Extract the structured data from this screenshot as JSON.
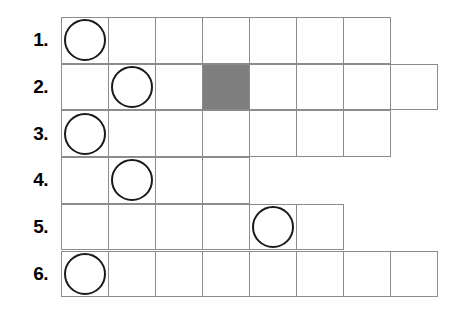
{
  "worksheet": {
    "title": "Counting grid worksheet",
    "grid": {
      "cell_width": 48,
      "cell_height": 46.7,
      "origin_x": 61,
      "origin_y": 17,
      "line_color": "#8c8c8c",
      "shaded_color": "#7f7f7f",
      "token_border_color": "#1a1a1a",
      "token_fill_color": "#ffffff"
    },
    "rows": [
      {
        "label": "1.",
        "cell_count": 7,
        "cells": [
          {
            "index": 1,
            "token": "circle",
            "shaded": false
          },
          {
            "index": 2,
            "token": null,
            "shaded": false
          },
          {
            "index": 3,
            "token": null,
            "shaded": false
          },
          {
            "index": 4,
            "token": null,
            "shaded": false
          },
          {
            "index": 5,
            "token": null,
            "shaded": false
          },
          {
            "index": 6,
            "token": null,
            "shaded": false
          },
          {
            "index": 7,
            "token": null,
            "shaded": false
          }
        ]
      },
      {
        "label": "2.",
        "cell_count": 8,
        "cells": [
          {
            "index": 1,
            "token": null,
            "shaded": false
          },
          {
            "index": 2,
            "token": "circle",
            "shaded": false
          },
          {
            "index": 3,
            "token": null,
            "shaded": false
          },
          {
            "index": 4,
            "token": null,
            "shaded": true
          },
          {
            "index": 5,
            "token": null,
            "shaded": false
          },
          {
            "index": 6,
            "token": null,
            "shaded": false
          },
          {
            "index": 7,
            "token": null,
            "shaded": false
          },
          {
            "index": 8,
            "token": null,
            "shaded": false
          }
        ]
      },
      {
        "label": "3.",
        "cell_count": 7,
        "cells": [
          {
            "index": 1,
            "token": "circle",
            "shaded": false
          },
          {
            "index": 2,
            "token": null,
            "shaded": false
          },
          {
            "index": 3,
            "token": null,
            "shaded": false
          },
          {
            "index": 4,
            "token": null,
            "shaded": false
          },
          {
            "index": 5,
            "token": null,
            "shaded": false
          },
          {
            "index": 6,
            "token": null,
            "shaded": false
          },
          {
            "index": 7,
            "token": null,
            "shaded": false
          }
        ]
      },
      {
        "label": "4.",
        "cell_count": 4,
        "cells": [
          {
            "index": 1,
            "token": null,
            "shaded": false
          },
          {
            "index": 2,
            "token": "circle",
            "shaded": false
          },
          {
            "index": 3,
            "token": null,
            "shaded": false
          },
          {
            "index": 4,
            "token": null,
            "shaded": false
          }
        ]
      },
      {
        "label": "5.",
        "cell_count": 6,
        "cells": [
          {
            "index": 1,
            "token": null,
            "shaded": false
          },
          {
            "index": 2,
            "token": null,
            "shaded": false
          },
          {
            "index": 3,
            "token": null,
            "shaded": false
          },
          {
            "index": 4,
            "token": null,
            "shaded": false
          },
          {
            "index": 5,
            "token": "circle",
            "shaded": false
          },
          {
            "index": 6,
            "token": null,
            "shaded": false
          }
        ]
      },
      {
        "label": "6.",
        "cell_count": 8,
        "cells": [
          {
            "index": 1,
            "token": "circle",
            "shaded": false
          },
          {
            "index": 2,
            "token": null,
            "shaded": false
          },
          {
            "index": 3,
            "token": null,
            "shaded": false
          },
          {
            "index": 4,
            "token": null,
            "shaded": false
          },
          {
            "index": 5,
            "token": null,
            "shaded": false
          },
          {
            "index": 6,
            "token": null,
            "shaded": false
          },
          {
            "index": 7,
            "token": null,
            "shaded": false
          },
          {
            "index": 8,
            "token": null,
            "shaded": false
          }
        ]
      }
    ]
  }
}
